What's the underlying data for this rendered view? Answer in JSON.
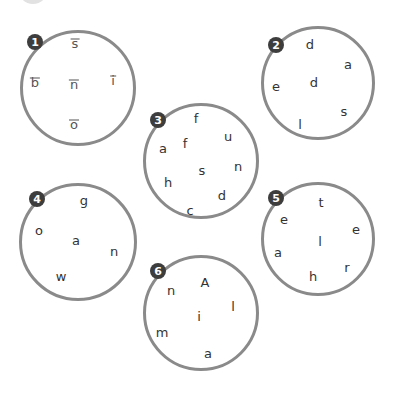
{
  "colors": {
    "circle_border": "#8a8a8a",
    "badge_bg": "#3d3d3d",
    "badge_text": "#ffffff",
    "letter": "#333333"
  },
  "puzzles": [
    {
      "number": "1",
      "example": true,
      "letters": [
        "s",
        "b",
        "n",
        "i",
        "o"
      ]
    },
    {
      "number": "2",
      "example": false,
      "letters": [
        "d",
        "a",
        "e",
        "d",
        "s",
        "l"
      ]
    },
    {
      "number": "3",
      "example": false,
      "letters": [
        "f",
        "u",
        "a",
        "f",
        "s",
        "n",
        "h",
        "d",
        "c"
      ]
    },
    {
      "number": "4",
      "example": false,
      "letters": [
        "g",
        "o",
        "a",
        "n",
        "w"
      ]
    },
    {
      "number": "5",
      "example": false,
      "letters": [
        "t",
        "e",
        "e",
        "l",
        "a",
        "r",
        "h"
      ]
    },
    {
      "number": "6",
      "example": false,
      "letters": [
        "A",
        "n",
        "l",
        "i",
        "m",
        "a"
      ]
    }
  ]
}
